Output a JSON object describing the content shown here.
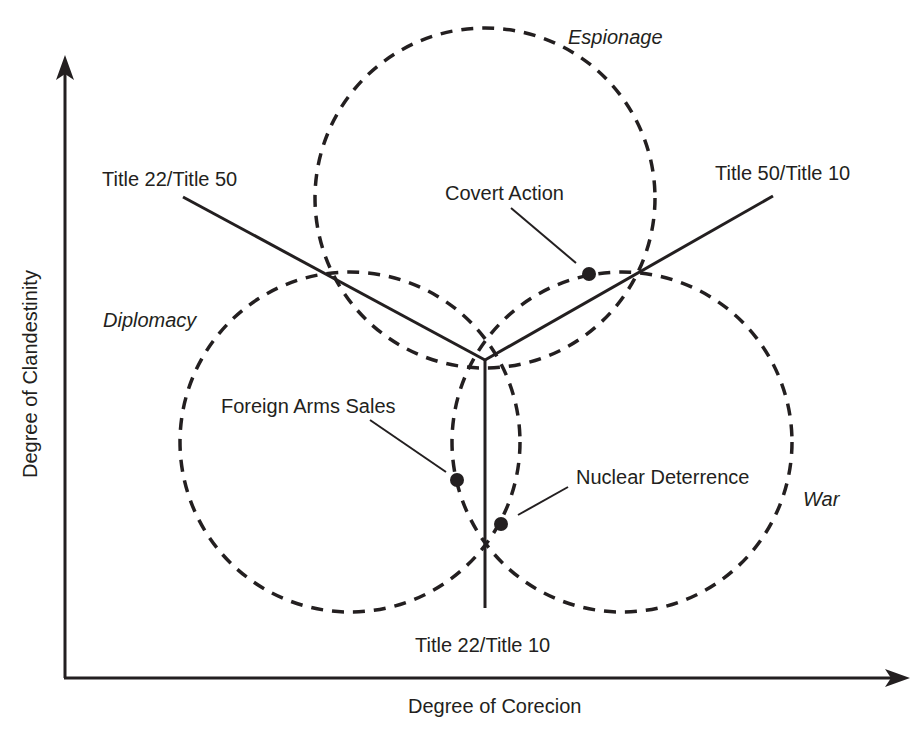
{
  "diagram": {
    "axes": {
      "y_label": "Degree of Clandestinity",
      "x_label": "Degree of Corecion"
    },
    "domains": [
      {
        "name": "Espionage",
        "cx": 485,
        "cy": 198,
        "r": 170
      },
      {
        "name": "Diplomacy",
        "cx": 350,
        "cy": 442,
        "r": 170
      },
      {
        "name": "War",
        "cx": 622,
        "cy": 442,
        "r": 170
      }
    ],
    "boundaries": [
      {
        "label": "Title 22/Title 50"
      },
      {
        "label": "Title 50/Title 10"
      },
      {
        "label": "Title 22/Title 10"
      }
    ],
    "activities": [
      {
        "label": "Covert Action",
        "x": 589,
        "y": 274
      },
      {
        "label": "Foreign Arms Sales",
        "x": 457,
        "y": 480
      },
      {
        "label": "Nuclear Deterrence",
        "x": 501,
        "y": 524
      }
    ],
    "colors": {
      "ink": "#231f20",
      "background": "#ffffff"
    }
  }
}
